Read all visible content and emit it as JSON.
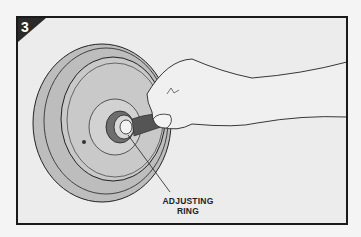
{
  "figure": {
    "step_number": "3",
    "callout_label_line1": "ADJUSTING",
    "callout_label_line2": "RING",
    "callout_target": "adjusting ring"
  },
  "colors": {
    "background": "#ececec",
    "frame": "#1a1a1a",
    "plate": "#bdbdbd",
    "wrench": "#555555",
    "skin": "#f0f0f0"
  }
}
